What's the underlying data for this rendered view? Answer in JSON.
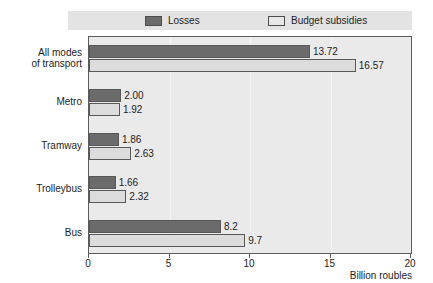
{
  "chart_data": {
    "type": "bar",
    "orientation": "horizontal",
    "title": "",
    "xlabel": "Billion roubles",
    "ylabel": "",
    "xlim": [
      0,
      20
    ],
    "xticks": [
      0,
      5,
      10,
      15,
      20
    ],
    "xtick_labels": [
      "0",
      "5",
      "10",
      "15",
      "20"
    ],
    "grid": true,
    "legend_position": "top",
    "categories": [
      "All modes of transport",
      "Metro",
      "Tramway",
      "Trolleybus",
      "Bus"
    ],
    "series": [
      {
        "name": "Losses",
        "color": "#6b6b6b",
        "values": [
          13.72,
          2.0,
          1.86,
          1.66,
          8.2
        ],
        "labels": [
          "13.72",
          "2.00",
          "1.86",
          "1.66",
          "8.2"
        ]
      },
      {
        "name": "Budget subsidies",
        "color": "#dcdcdc",
        "values": [
          16.57,
          1.92,
          2.63,
          2.32,
          9.7
        ],
        "labels": [
          "16.57",
          "1.92",
          "2.63",
          "2.32",
          "9.7"
        ]
      }
    ]
  },
  "legend": {
    "items": [
      {
        "label": "Losses",
        "color": "#6b6b6b"
      },
      {
        "label": "Budget subsidies",
        "color": "#e8e8e8"
      }
    ]
  },
  "axis": {
    "x_title": "Billion roubles"
  },
  "category_lines": [
    [
      "All modes",
      "of transport"
    ],
    [
      "Metro"
    ],
    [
      "Tramway"
    ],
    [
      "Trolleybus"
    ],
    [
      "Bus"
    ]
  ]
}
